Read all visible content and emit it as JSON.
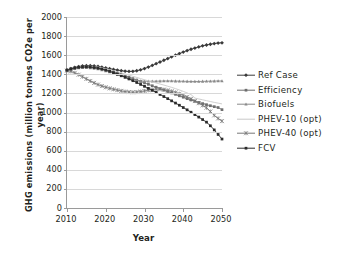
{
  "chart_data": {
    "type": "line",
    "title": "",
    "xlabel": "Year",
    "ylabel": "GHG emissions (million tonnes CO2e per year)",
    "xlim": [
      2010,
      2050
    ],
    "ylim": [
      0,
      2000
    ],
    "xticks": [
      "2010",
      "2020",
      "2030",
      "2040",
      "2050"
    ],
    "yticks": [
      "0",
      "200",
      "400",
      "600",
      "800",
      "1000",
      "1200",
      "1400",
      "1600",
      "1800",
      "2000"
    ],
    "grid": true,
    "legend_position": "right",
    "x": [
      2010,
      2011,
      2012,
      2013,
      2014,
      2015,
      2016,
      2017,
      2018,
      2019,
      2020,
      2021,
      2022,
      2023,
      2024,
      2025,
      2026,
      2027,
      2028,
      2029,
      2030,
      2031,
      2032,
      2033,
      2034,
      2035,
      2036,
      2037,
      2038,
      2039,
      2040,
      2041,
      2042,
      2043,
      2044,
      2045,
      2046,
      2047,
      2048,
      2049,
      2050
    ],
    "series": [
      {
        "name": "Ref Case",
        "color": "#3a3a3a",
        "marker": "diamond",
        "values": [
          1445,
          1460,
          1472,
          1481,
          1487,
          1490,
          1490,
          1487,
          1482,
          1475,
          1467,
          1459,
          1451,
          1444,
          1438,
          1433,
          1430,
          1431,
          1437,
          1447,
          1460,
          1476,
          1493,
          1511,
          1529,
          1547,
          1565,
          1583,
          1600,
          1617,
          1633,
          1648,
          1662,
          1675,
          1687,
          1698,
          1707,
          1715,
          1722,
          1727,
          1730
        ]
      },
      {
        "name": "Efficiency",
        "color": "#6e6e6e",
        "marker": "square",
        "values": [
          1442,
          1455,
          1465,
          1472,
          1476,
          1478,
          1477,
          1473,
          1467,
          1459,
          1449,
          1438,
          1426,
          1413,
          1399,
          1385,
          1370,
          1355,
          1340,
          1325,
          1310,
          1295,
          1280,
          1265,
          1250,
          1235,
          1220,
          1205,
          1190,
          1175,
          1160,
          1145,
          1131,
          1118,
          1105,
          1093,
          1082,
          1071,
          1061,
          1052,
          1030
        ]
      },
      {
        "name": "Biofuels",
        "color": "#8a8a8a",
        "marker": "triangle",
        "values": [
          1441,
          1452,
          1460,
          1466,
          1469,
          1470,
          1468,
          1463,
          1456,
          1447,
          1436,
          1424,
          1411,
          1397,
          1383,
          1369,
          1356,
          1345,
          1337,
          1331,
          1328,
          1327,
          1327,
          1328,
          1329,
          1330,
          1330,
          1330,
          1329,
          1328,
          1327,
          1326,
          1325,
          1325,
          1325,
          1326,
          1327,
          1328,
          1329,
          1330,
          1330
        ]
      },
      {
        "name": "PHEV-10 (opt)",
        "color": "#c9c9c9",
        "marker": "none",
        "values": [
          1444,
          1457,
          1468,
          1476,
          1481,
          1483,
          1483,
          1480,
          1475,
          1468,
          1459,
          1449,
          1438,
          1427,
          1415,
          1403,
          1391,
          1379,
          1367,
          1355,
          1343,
          1331,
          1320,
          1309,
          1298,
          1287,
          1275,
          1263,
          1250,
          1236,
          1221,
          1205,
          1188,
          1151,
          1142,
          1133,
          1124,
          1115,
          1106,
          1098,
          1090
        ]
      },
      {
        "name": "PHEV-40 (opt)",
        "color": "#777777",
        "marker": "star",
        "values": [
          1438,
          1430,
          1415,
          1396,
          1375,
          1352,
          1330,
          1310,
          1292,
          1277,
          1264,
          1253,
          1243,
          1234,
          1226,
          1219,
          1214,
          1212,
          1214,
          1219,
          1226,
          1233,
          1240,
          1244,
          1244,
          1240,
          1232,
          1222,
          1210,
          1196,
          1180,
          1162,
          1142,
          1120,
          1098,
          1075,
          1050,
          1010,
          970,
          938,
          910
        ]
      },
      {
        "name": "FCV",
        "color": "#2b2b2b",
        "marker": "circle",
        "values": [
          1443,
          1456,
          1466,
          1473,
          1477,
          1478,
          1476,
          1471,
          1464,
          1455,
          1444,
          1431,
          1417,
          1402,
          1386,
          1369,
          1351,
          1333,
          1314,
          1294,
          1274,
          1253,
          1232,
          1211,
          1189,
          1167,
          1145,
          1122,
          1099,
          1076,
          1052,
          1028,
          1003,
          978,
          952,
          926,
          899,
          861,
          818,
          770,
          722
        ]
      }
    ]
  },
  "legend": {
    "items": [
      {
        "label": "Ref Case"
      },
      {
        "label": "Efficiency"
      },
      {
        "label": "Biofuels"
      },
      {
        "label": "PHEV-10 (opt)"
      },
      {
        "label": "PHEV-40 (opt)"
      },
      {
        "label": "FCV"
      }
    ]
  }
}
